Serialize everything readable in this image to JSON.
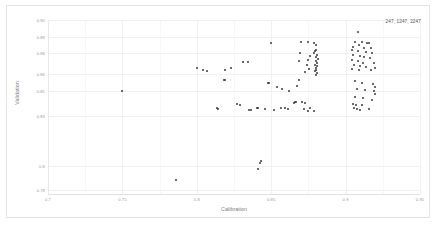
{
  "chart_data": {
    "type": "scatter",
    "title": "",
    "xlabel": "Calibration",
    "ylabel": "Validation",
    "annotation": "247, 1247, 2247",
    "xlim": [
      0.7,
      0.95
    ],
    "ylim": [
      0.78,
      0.905
    ],
    "grid": true,
    "legend_position": "top-right",
    "xticks": [
      "0.7",
      "0.75",
      "0.8",
      "0.85",
      "0.9",
      "0.95"
    ],
    "xtick_values": [
      0.7,
      0.75,
      0.8,
      0.85,
      0.9,
      0.95
    ],
    "yticks": [
      "0.90",
      "0.89",
      "0.88",
      "0.86",
      "0.85",
      "0.83",
      "0.8",
      "0.78"
    ],
    "ytick_values": [
      0.905,
      0.893,
      0.881,
      0.866,
      0.854,
      0.836,
      0.8,
      0.783
    ],
    "marker_color": "#3a3a3a",
    "marker_size": 2,
    "series": [
      {
        "name": "247, 1247, 2247",
        "points": [
          [
            0.7497,
            0.854
          ],
          [
            0.8501,
            0.8886
          ],
          [
            0.8312,
            0.875
          ],
          [
            0.8345,
            0.8748
          ],
          [
            0.8228,
            0.8706
          ],
          [
            0.819,
            0.8689
          ],
          [
            0.848,
            0.86
          ],
          [
            0.8486,
            0.8598
          ],
          [
            0.862,
            0.8538
          ],
          [
            0.8668,
            0.8458
          ],
          [
            0.865,
            0.8455
          ],
          [
            0.871,
            0.846
          ],
          [
            0.873,
            0.8452
          ],
          [
            0.8564,
            0.8421
          ],
          [
            0.859,
            0.8418
          ],
          [
            0.861,
            0.8412
          ],
          [
            0.8518,
            0.8404
          ],
          [
            0.87,
            0.8893
          ],
          [
            0.8744,
            0.8892
          ],
          [
            0.879,
            0.8884
          ],
          [
            0.8802,
            0.887
          ],
          [
            0.88,
            0.8836
          ],
          [
            0.8795,
            0.8824
          ],
          [
            0.8788,
            0.8812
          ],
          [
            0.8806,
            0.8796
          ],
          [
            0.8802,
            0.8782
          ],
          [
            0.8812,
            0.877
          ],
          [
            0.8798,
            0.8758
          ],
          [
            0.8808,
            0.8744
          ],
          [
            0.8792,
            0.873
          ],
          [
            0.881,
            0.8718
          ],
          [
            0.88,
            0.8706
          ],
          [
            0.8804,
            0.8694
          ],
          [
            0.8796,
            0.8682
          ],
          [
            0.881,
            0.867
          ],
          [
            0.8798,
            0.8658
          ],
          [
            0.8762,
            0.879
          ],
          [
            0.8746,
            0.8762
          ],
          [
            0.8738,
            0.8724
          ],
          [
            0.8754,
            0.87
          ],
          [
            0.8724,
            0.8676
          ],
          [
            0.8696,
            0.8812
          ],
          [
            0.8684,
            0.8756
          ],
          [
            0.869,
            0.8622
          ],
          [
            0.8672,
            0.8576
          ],
          [
            0.8662,
            0.8464
          ],
          [
            0.8718,
            0.841
          ],
          [
            0.876,
            0.8418
          ],
          [
            0.8744,
            0.8398
          ],
          [
            0.8788,
            0.8394
          ],
          [
            0.908,
            0.8962
          ],
          [
            0.906,
            0.8894
          ],
          [
            0.9108,
            0.889
          ],
          [
            0.9144,
            0.8886
          ],
          [
            0.9154,
            0.8882
          ],
          [
            0.909,
            0.8868
          ],
          [
            0.9048,
            0.8856
          ],
          [
            0.9124,
            0.8852
          ],
          [
            0.9168,
            0.8848
          ],
          [
            0.9042,
            0.8836
          ],
          [
            0.9086,
            0.883
          ],
          [
            0.9136,
            0.882
          ],
          [
            0.9178,
            0.8812
          ],
          [
            0.905,
            0.88
          ],
          [
            0.9094,
            0.8794
          ],
          [
            0.9122,
            0.8786
          ],
          [
            0.9162,
            0.8778
          ],
          [
            0.904,
            0.876
          ],
          [
            0.9082,
            0.8752
          ],
          [
            0.9118,
            0.8744
          ],
          [
            0.919,
            0.8742
          ],
          [
            0.9056,
            0.8728
          ],
          [
            0.91,
            0.872
          ],
          [
            0.914,
            0.871
          ],
          [
            0.9196,
            0.8706
          ],
          [
            0.9046,
            0.87
          ],
          [
            0.9088,
            0.8694
          ],
          [
            0.9172,
            0.8688
          ],
          [
            0.906,
            0.8612
          ],
          [
            0.9112,
            0.8596
          ],
          [
            0.9186,
            0.8588
          ],
          [
            0.9198,
            0.8566
          ],
          [
            0.9074,
            0.8556
          ],
          [
            0.913,
            0.8544
          ],
          [
            0.9188,
            0.8538
          ],
          [
            0.9196,
            0.852
          ],
          [
            0.9064,
            0.85
          ],
          [
            0.912,
            0.8492
          ],
          [
            0.9178,
            0.8478
          ],
          [
            0.9052,
            0.845
          ],
          [
            0.907,
            0.8442
          ],
          [
            0.9108,
            0.8438
          ],
          [
            0.9056,
            0.8418
          ],
          [
            0.9074,
            0.8408
          ],
          [
            0.91,
            0.8404
          ],
          [
            0.9154,
            0.841
          ],
          [
            0.7998,
            0.8708
          ],
          [
            0.8044,
            0.8694
          ],
          [
            0.8068,
            0.8686
          ],
          [
            0.818,
            0.862
          ],
          [
            0.8192,
            0.8616
          ],
          [
            0.8268,
            0.8448
          ],
          [
            0.829,
            0.8442
          ],
          [
            0.8134,
            0.8418
          ],
          [
            0.8142,
            0.8412
          ],
          [
            0.8402,
            0.842
          ],
          [
            0.8408,
            0.8415
          ],
          [
            0.846,
            0.8412
          ],
          [
            0.8366,
            0.8402
          ],
          [
            0.8352,
            0.8404
          ],
          [
            0.843,
            0.804
          ],
          [
            0.8428,
            0.8022
          ],
          [
            0.8408,
            0.798
          ],
          [
            0.786,
            0.79
          ],
          [
            0.8536,
            0.8566
          ],
          [
            0.857,
            0.8552
          ]
        ]
      }
    ]
  }
}
